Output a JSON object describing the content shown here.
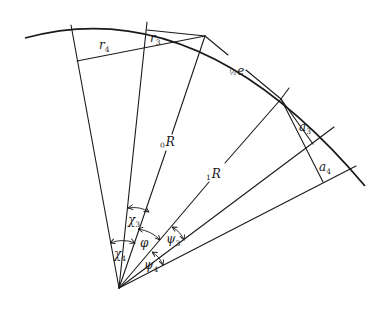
{
  "diagram": {
    "type": "geometric-construction",
    "labels": {
      "r4": {
        "base": "r",
        "sub": "4"
      },
      "r3": {
        "base": "r",
        "sub": "3"
      },
      "half_e": {
        "frac": "½",
        "base": "e"
      },
      "a3": {
        "base": "a",
        "sub": "3"
      },
      "a4": {
        "base": "a",
        "sub": "4"
      },
      "R0": {
        "pre": "0",
        "base": "R"
      },
      "R1": {
        "pre": "1",
        "base": "R"
      },
      "chi3": {
        "base": "χ",
        "sub": "3"
      },
      "chi4": {
        "base": "χ",
        "sub": "4"
      },
      "phi": {
        "base": "φ"
      },
      "psi3": {
        "base": "ψ",
        "sub": "3"
      },
      "psi4": {
        "base": "ψ",
        "sub": "4"
      }
    },
    "colors": {
      "ink": "#1a1a1a",
      "background": "#ffffff"
    }
  }
}
